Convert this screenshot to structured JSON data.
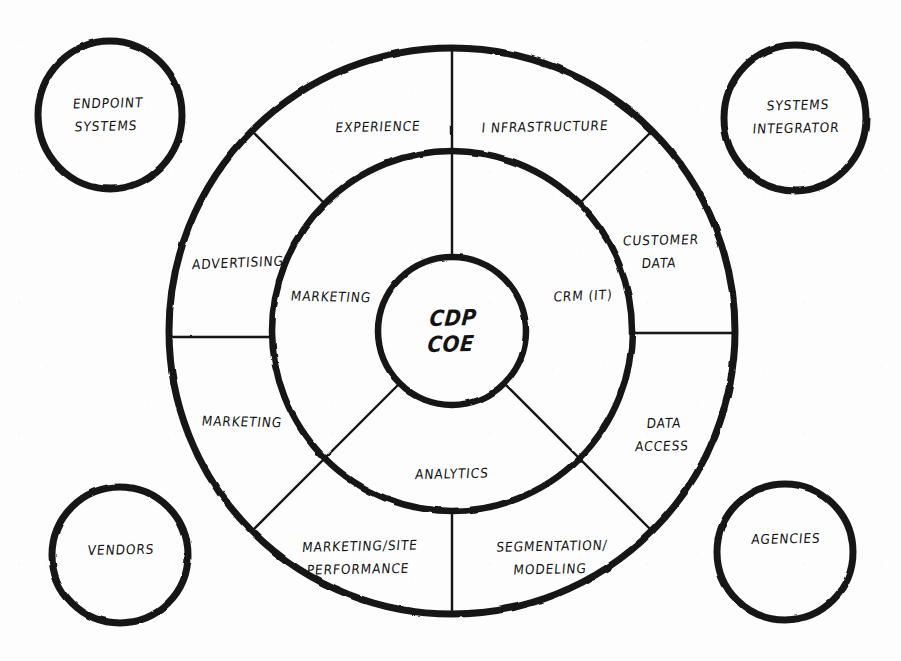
{
  "diagram": {
    "type": "concentric-ring-diagram",
    "stroke_color": "#151515",
    "background_color": "#fdfdfd",
    "core": {
      "label_line1": "CDP",
      "label_line2": "COE",
      "cx": 452,
      "cy": 331,
      "r": 74
    },
    "inner_ring": {
      "r_inner": 74,
      "r_outer": 180,
      "segments": [
        {
          "name": "infrastructure",
          "label": "I NFRASTRUCTURE",
          "label_x": 545,
          "label_y": 127
        },
        {
          "name": "crm-it",
          "label": "CRM (IT)",
          "label_x": 583,
          "label_y": 296
        },
        {
          "name": "analytics",
          "label": "ANALYTICS",
          "label_x": 452,
          "label_y": 474
        },
        {
          "name": "marketing-inner",
          "label": "MARKETING",
          "label_x": 331,
          "label_y": 297
        },
        {
          "name": "experience",
          "label": "EXPERIENCE",
          "label_x": 378,
          "label_y": 127
        }
      ]
    },
    "outer_ring": {
      "r_inner": 180,
      "r_outer": 283,
      "segments": [
        {
          "name": "customer-data",
          "label_line1": "CUSTOMER",
          "label_line2": "DATA",
          "label_x": 660,
          "label_y": 252
        },
        {
          "name": "data-access",
          "label_line1": "DATA",
          "label_line2": "ACCESS",
          "label_x": 663,
          "label_y": 435
        },
        {
          "name": "segmentation-modeling",
          "label_line1": "SEGMENTATION/",
          "label_line2": "MODELING",
          "label_x": 551,
          "label_y": 558
        },
        {
          "name": "marketing-site-performance",
          "label_line1": "MARKETING/SITE",
          "label_line2": "PERFORMANCE",
          "label_x": 359,
          "label_y": 558
        },
        {
          "name": "marketing-outer",
          "label": "MARKETING",
          "label_x": 242,
          "label_y": 422
        },
        {
          "name": "advertising",
          "label": "ADVERTISING",
          "label_x": 238,
          "label_y": 263
        }
      ]
    },
    "satellites": [
      {
        "name": "endpoint-systems",
        "label_line1": "ENDPOINT",
        "label_line2": "SYSTEMS",
        "cx": 110,
        "cy": 115,
        "rx": 72,
        "ry": 74,
        "label_x": 107,
        "label_y": 115
      },
      {
        "name": "systems-integrator",
        "label_line1": "SYSTEMS",
        "label_line2": "INTEGRATOR",
        "cx": 795,
        "cy": 118,
        "rx": 71,
        "ry": 73,
        "label_x": 797,
        "label_y": 117
      },
      {
        "name": "vendors",
        "label_line1": "VENDORS",
        "label_line2": "",
        "cx": 120,
        "cy": 555,
        "rx": 68,
        "ry": 68,
        "label_x": 121,
        "label_y": 550
      },
      {
        "name": "agencies",
        "label_line1": "AGENCIES",
        "label_line2": "",
        "cx": 785,
        "cy": 552,
        "rx": 68,
        "ry": 68,
        "label_x": 786,
        "label_y": 539
      }
    ]
  }
}
